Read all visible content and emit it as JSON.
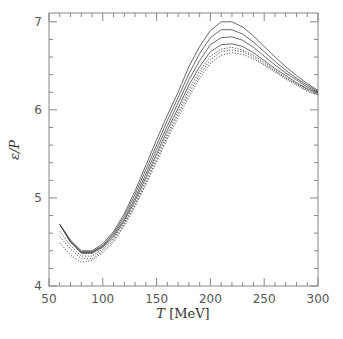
{
  "chart_data": {
    "type": "line",
    "title": "",
    "xlabel": "T [MeV]",
    "ylabel": "ε/P",
    "xlim": [
      50,
      300
    ],
    "ylim": [
      4,
      7.1
    ],
    "xticks": [
      50,
      100,
      150,
      200,
      250,
      300
    ],
    "yticks": [
      4,
      5,
      6,
      7
    ],
    "x_minor_step": 10,
    "y_minor_step": 0.2,
    "grid": false,
    "legend": null,
    "x": [
      60,
      70,
      80,
      90,
      100,
      110,
      120,
      130,
      140,
      150,
      160,
      170,
      180,
      190,
      200,
      210,
      220,
      230,
      240,
      250,
      260,
      270,
      280,
      290,
      300
    ],
    "series": [
      {
        "name": "curve 1 (solid)",
        "style": "solid",
        "values": [
          4.7,
          4.52,
          4.4,
          4.4,
          4.48,
          4.62,
          4.82,
          5.08,
          5.37,
          5.66,
          5.94,
          6.2,
          6.49,
          6.72,
          6.9,
          7.0,
          7.0,
          6.94,
          6.84,
          6.72,
          6.6,
          6.49,
          6.39,
          6.3,
          6.22
        ]
      },
      {
        "name": "curve 2 (solid)",
        "style": "solid",
        "values": [
          4.7,
          4.51,
          4.39,
          4.39,
          4.46,
          4.6,
          4.79,
          5.04,
          5.32,
          5.6,
          5.88,
          6.14,
          6.41,
          6.64,
          6.82,
          6.91,
          6.91,
          6.86,
          6.77,
          6.66,
          6.55,
          6.45,
          6.36,
          6.28,
          6.21
        ]
      },
      {
        "name": "curve 3 (solid)",
        "style": "solid",
        "values": [
          4.7,
          4.5,
          4.38,
          4.38,
          4.45,
          4.58,
          4.76,
          5.0,
          5.27,
          5.55,
          5.82,
          6.08,
          6.34,
          6.56,
          6.74,
          6.82,
          6.83,
          6.79,
          6.71,
          6.61,
          6.51,
          6.42,
          6.34,
          6.26,
          6.2
        ]
      },
      {
        "name": "curve 4 (solid)",
        "style": "solid",
        "values": [
          4.7,
          4.5,
          4.37,
          4.37,
          4.44,
          4.56,
          4.74,
          4.97,
          5.23,
          5.5,
          5.77,
          6.02,
          6.28,
          6.49,
          6.66,
          6.74,
          6.75,
          6.72,
          6.65,
          6.56,
          6.47,
          6.39,
          6.31,
          6.24,
          6.19
        ]
      },
      {
        "name": "curve 5 (dotted)",
        "style": "dotted",
        "values": [
          4.62,
          4.46,
          4.34,
          4.34,
          4.42,
          4.54,
          4.72,
          4.94,
          5.2,
          5.47,
          5.73,
          5.98,
          6.23,
          6.44,
          6.61,
          6.69,
          6.71,
          6.68,
          6.62,
          6.54,
          6.45,
          6.37,
          6.3,
          6.23,
          6.18
        ]
      },
      {
        "name": "curve 6 (dotted)",
        "style": "dotted",
        "values": [
          4.56,
          4.42,
          4.31,
          4.31,
          4.4,
          4.52,
          4.7,
          4.92,
          5.17,
          5.44,
          5.7,
          5.95,
          6.19,
          6.4,
          6.57,
          6.66,
          6.68,
          6.66,
          6.6,
          6.52,
          6.44,
          6.36,
          6.29,
          6.22,
          6.17
        ]
      },
      {
        "name": "curve 7 (dotted)",
        "style": "dotted",
        "values": [
          4.49,
          4.35,
          4.27,
          4.29,
          4.38,
          4.5,
          4.68,
          4.9,
          5.15,
          5.41,
          5.67,
          5.91,
          6.15,
          6.36,
          6.53,
          6.62,
          6.65,
          6.63,
          6.58,
          6.51,
          6.43,
          6.35,
          6.28,
          6.21,
          6.17
        ]
      }
    ]
  }
}
